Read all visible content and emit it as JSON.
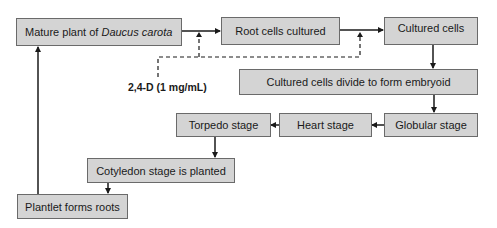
{
  "diagram": {
    "nodes": {
      "mature_plant": {
        "prefix": "Mature plant of ",
        "italic": "Daucus carota"
      },
      "root_cells": "Root cells cultured",
      "cultured_cells": "Cultured cells",
      "embryoid": "Cultured cells divide to form embryoid",
      "globular": "Globular stage",
      "heart": "Heart stage",
      "torpedo": "Torpedo stage",
      "cotyledon": "Cotyledon stage is planted",
      "plantlet": "Plantlet forms roots"
    },
    "annotation": "2,4-D (1 mg/mL)",
    "edges": [
      {
        "from": "mature_plant",
        "to": "root_cells",
        "style": "solid"
      },
      {
        "from": "root_cells",
        "to": "cultured_cells",
        "style": "solid"
      },
      {
        "from": "cultured_cells",
        "to": "embryoid",
        "style": "solid"
      },
      {
        "from": "embryoid",
        "to": "globular",
        "style": "solid"
      },
      {
        "from": "globular",
        "to": "heart",
        "style": "solid"
      },
      {
        "from": "heart",
        "to": "torpedo",
        "style": "solid"
      },
      {
        "from": "torpedo",
        "to": "cotyledon",
        "style": "solid"
      },
      {
        "from": "cotyledon",
        "to": "plantlet",
        "style": "solid"
      },
      {
        "from": "plantlet",
        "to": "mature_plant",
        "style": "solid"
      },
      {
        "from": "annotation",
        "to": "mature_plant->root_cells",
        "style": "dashed"
      },
      {
        "from": "annotation",
        "to": "root_cells->cultured_cells",
        "style": "dashed"
      }
    ]
  }
}
